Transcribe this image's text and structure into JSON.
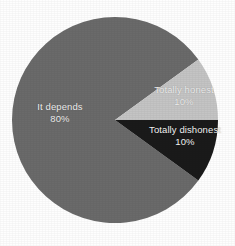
{
  "chart_data": {
    "type": "pie",
    "title": "",
    "subtitle": "",
    "xlabel": "",
    "ylabel": "",
    "legend_position": "none",
    "grid": false,
    "labels_inside": true,
    "categories": [
      "It depends",
      "Totally honest",
      "Totally dishonest"
    ],
    "values": [
      80,
      10,
      10
    ],
    "value_unit": "%",
    "slices": [
      {
        "label": "It depends",
        "value": 80,
        "value_text": "80%",
        "color": "#6a6a6a",
        "start_angle_deg": 36,
        "sweep_deg": 288
      },
      {
        "label": "Totally honest",
        "value": 10,
        "value_text": "10%",
        "color": "#c4c4c4",
        "start_angle_deg": 324,
        "sweep_deg": 36
      },
      {
        "label": "Totally dishonest",
        "value": 10,
        "value_text": "10%",
        "color": "#1a1a1a",
        "start_angle_deg": 0,
        "sweep_deg": 36
      }
    ]
  },
  "figure": {
    "background_color": "#fefefe",
    "label_text_color": "#f2f2f2",
    "center_x": 115,
    "center_y": 120,
    "radius": 103
  },
  "labels": {
    "it_depends": {
      "name": "It depends",
      "percent": "80%"
    },
    "totally_honest": {
      "name": "Totally honest",
      "percent": "10%"
    },
    "totally_dishonest": {
      "name": "Totally dishonest",
      "percent": "10%"
    }
  }
}
